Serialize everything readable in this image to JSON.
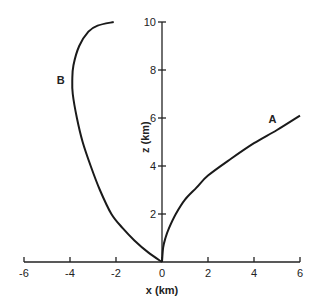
{
  "chart_data": {
    "type": "line",
    "title": "",
    "xlabel": "x (km)",
    "ylabel": "z (km)",
    "xlim": [
      -6,
      6
    ],
    "ylim": [
      0,
      10
    ],
    "grid": false,
    "legend": "none (curves labeled inline)",
    "x_ticks": [
      -6,
      -4,
      -2,
      0,
      2,
      4,
      6
    ],
    "y_ticks": [
      2,
      4,
      6,
      8,
      10
    ],
    "x_tick_labels": [
      "-6",
      "-4",
      "-2",
      "0",
      "2",
      "4",
      "6"
    ],
    "y_tick_labels": [
      "2",
      "4",
      "6",
      "8",
      "10"
    ],
    "series": [
      {
        "name": "A",
        "label_position": [
          4.8,
          5.8
        ],
        "points": [
          [
            0,
            0
          ],
          [
            0.05,
            0.6
          ],
          [
            0.15,
            1.0
          ],
          [
            0.3,
            1.4
          ],
          [
            0.6,
            2.0
          ],
          [
            1.0,
            2.6
          ],
          [
            1.5,
            3.1
          ],
          [
            2.0,
            3.6
          ],
          [
            3.0,
            4.3
          ],
          [
            4.0,
            4.95
          ],
          [
            5.0,
            5.5
          ],
          [
            6.0,
            6.1
          ]
        ]
      },
      {
        "name": "B",
        "label_position": [
          -4.4,
          7.4
        ],
        "points": [
          [
            0,
            0
          ],
          [
            -0.6,
            0.4
          ],
          [
            -1.2,
            0.9
          ],
          [
            -1.7,
            1.4
          ],
          [
            -2.2,
            2.0
          ],
          [
            -2.7,
            3.0
          ],
          [
            -3.1,
            4.0
          ],
          [
            -3.45,
            5.0
          ],
          [
            -3.7,
            6.0
          ],
          [
            -3.88,
            7.0
          ],
          [
            -3.9,
            7.6
          ],
          [
            -3.85,
            8.2
          ],
          [
            -3.6,
            9.0
          ],
          [
            -3.2,
            9.6
          ],
          [
            -2.8,
            9.85
          ],
          [
            -2.1,
            10.0
          ]
        ]
      }
    ]
  }
}
